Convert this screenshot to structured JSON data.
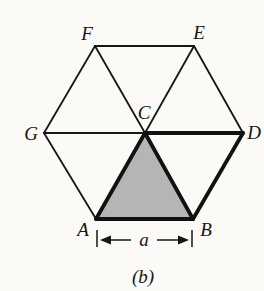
{
  "figure": {
    "vertex_labels": {
      "F": "F",
      "E": "E",
      "G": "G",
      "C": "C",
      "D": "D",
      "A": "A",
      "B": "B"
    },
    "dimension": {
      "label": "a"
    },
    "caption": "(b)",
    "colors": {
      "background": "#fbfaf6",
      "line": "#161616",
      "shaded_triangle": "#b5b5b5"
    }
  }
}
